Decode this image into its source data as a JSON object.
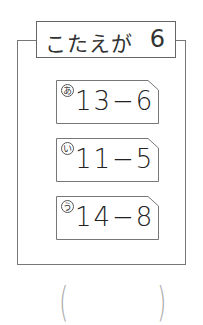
{
  "title": {
    "label": "こたえが",
    "value": "6"
  },
  "cards": [
    {
      "mark": "あ",
      "expression": "13−6"
    },
    {
      "mark": "い",
      "expression": "11−5"
    },
    {
      "mark": "う",
      "expression": "14−8"
    }
  ],
  "answer": {
    "open": "(",
    "close": ")",
    "value": ""
  }
}
